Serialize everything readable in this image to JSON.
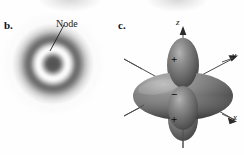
{
  "figure": {
    "panels": [
      {
        "letter": "b.",
        "name": "radial-electron-density",
        "callout": {
          "label": "Node",
          "description": "leader line pointing to the pale radial node ring"
        }
      },
      {
        "letter": "c.",
        "name": "dz2-orbital",
        "axes": [
          {
            "id": "z",
            "label": "z",
            "direction": "up"
          },
          {
            "id": "y",
            "label": "y",
            "direction": "upper-right"
          },
          {
            "id": "x",
            "label": "x",
            "direction": "lower-right"
          }
        ],
        "phase_signs": [
          {
            "id": "top-lobe",
            "label": "+"
          },
          {
            "id": "torus",
            "label": "−"
          },
          {
            "id": "bottom-lobe",
            "label": "+"
          }
        ]
      }
    ]
  },
  "colors": {
    "background": "#fefefe",
    "ink": "#111111",
    "cloud_dark": "#4a4a4a",
    "cloud_node": "#f5f5f5",
    "orbital_fill": "#6e6e6e",
    "orbital_shadow": "#3c3c3c",
    "orbital_highlight": "#a8a8a8",
    "axis_line": "#4c4c4c"
  }
}
